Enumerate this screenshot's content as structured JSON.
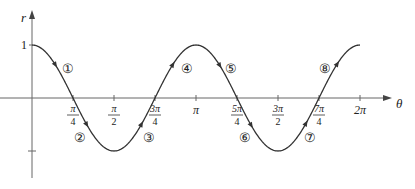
{
  "chart_data": {
    "type": "line",
    "title": "",
    "function": "r = cos 2θ",
    "xlabel": "θ",
    "ylabel": "r",
    "xlim": [
      0,
      6.2832
    ],
    "ylim": [
      -1,
      1
    ],
    "grid": false,
    "legend": "none",
    "x_ticks": [
      {
        "value": 0.7854,
        "num": "π",
        "den": "4"
      },
      {
        "value": 1.5708,
        "num": "π",
        "den": "2"
      },
      {
        "value": 2.3562,
        "num": "3π",
        "den": "4"
      },
      {
        "value": 3.1416,
        "label": "π"
      },
      {
        "value": 3.927,
        "num": "5π",
        "den": "4"
      },
      {
        "value": 4.7124,
        "num": "3π",
        "den": "2"
      },
      {
        "value": 5.4978,
        "num": "7π",
        "den": "4"
      },
      {
        "value": 6.2832,
        "label": "2π"
      }
    ],
    "y_ticks": [
      {
        "value": 1,
        "label": "1"
      },
      {
        "value": -1,
        "label": ""
      }
    ],
    "series": [
      {
        "name": "r = cos 2θ",
        "x": [
          0,
          0.3927,
          0.7854,
          1.1781,
          1.5708,
          1.9635,
          2.3562,
          2.7489,
          3.1416,
          3.5343,
          3.927,
          4.3197,
          4.7124,
          5.1051,
          5.4978,
          5.8905,
          6.2832
        ],
        "values": [
          1,
          0.7071,
          0,
          -0.7071,
          -1,
          -0.7071,
          0,
          0.7071,
          1,
          0.7071,
          0,
          -0.7071,
          -1,
          -0.7071,
          0,
          0.7071,
          1
        ]
      }
    ],
    "annotations": [
      {
        "label": "①",
        "x": 0.42,
        "segment": "0 to π/4"
      },
      {
        "label": "②",
        "x": 1.0,
        "segment": "π/4 to π/2"
      },
      {
        "label": "③",
        "x": 2.2,
        "segment": "π/2 to 3π/4"
      },
      {
        "label": "④",
        "x": 2.78,
        "segment": "3π/4 to π"
      },
      {
        "label": "⑤",
        "x": 3.6,
        "segment": "π to 5π/4"
      },
      {
        "label": "⑥",
        "x": 4.0,
        "segment": "5π/4 to 3π/2"
      },
      {
        "label": "⑦",
        "x": 5.4,
        "segment": "3π/2 to 7π/4"
      },
      {
        "label": "⑧",
        "x": 5.6,
        "segment": "7π/4 to 2π"
      }
    ]
  },
  "colors": {
    "curve": "#333333",
    "axis": "#555555",
    "text": "#222222"
  }
}
